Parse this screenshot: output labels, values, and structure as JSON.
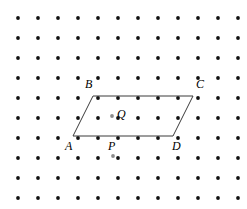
{
  "figure": {
    "kind": "geometry-dot-grid-diagram",
    "canvas": {
      "width": 247,
      "height": 209,
      "background": "#ffffff"
    },
    "grid": {
      "name": "square-dot-lattice",
      "columns": 12,
      "rows": 10,
      "origin_x": 18,
      "origin_y": 18,
      "spacing_x": 20,
      "spacing_y": 20,
      "dot_radius": 1.9,
      "dot_color": "#111111"
    },
    "shape": {
      "name": "parallelogram",
      "label": "ABCD",
      "stroke_color": "#3a3a3a",
      "stroke_width": 1,
      "fill": "none",
      "vertices": [
        {
          "id": "A",
          "x": 73,
          "y": 136
        },
        {
          "id": "B",
          "x": 93,
          "y": 96
        },
        {
          "id": "C",
          "x": 193,
          "y": 96
        },
        {
          "id": "D",
          "x": 173,
          "y": 136
        }
      ],
      "edges": [
        {
          "from": "A",
          "to": "B"
        },
        {
          "from": "B",
          "to": "C"
        },
        {
          "from": "C",
          "to": "D"
        },
        {
          "from": "D",
          "to": "A"
        }
      ]
    },
    "marked_points": [
      {
        "id": "P",
        "x": 113,
        "y": 136,
        "marker": "gray-dot",
        "marker_x": 113,
        "marker_y": 156,
        "marker_color": "#8c8c8c"
      },
      {
        "id": "Q",
        "x": 118,
        "y": 116,
        "marker": "gray-dot",
        "marker_x": 112,
        "marker_y": 116,
        "marker_color": "#8c8c8c"
      }
    ],
    "labels": [
      {
        "id": "label-A",
        "text": "A",
        "x": 65,
        "y": 140
      },
      {
        "id": "label-B",
        "text": "B",
        "x": 85,
        "y": 78
      },
      {
        "id": "label-C",
        "text": "C",
        "x": 196,
        "y": 78
      },
      {
        "id": "label-D",
        "text": "D",
        "x": 172,
        "y": 140
      },
      {
        "id": "label-P",
        "text": "P",
        "x": 108,
        "y": 140
      },
      {
        "id": "label-Q",
        "text": "Q",
        "x": 117,
        "y": 108
      }
    ]
  }
}
